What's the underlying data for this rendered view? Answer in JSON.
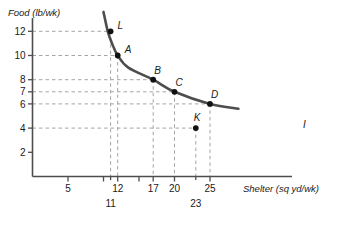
{
  "chart_data": {
    "type": "line",
    "title": "",
    "xlabel": "Shelter (sq yd/wk)",
    "ylabel": "Food (lb/wk)",
    "xlim": [
      0,
      29
    ],
    "ylim": [
      0,
      13.6
    ],
    "grid": "dashed-guides",
    "legend": "none",
    "curve_label": "I",
    "curve_description": "Indifference curve I, downward sloping convex",
    "curve_points": [
      {
        "x": 10.0,
        "y": 13.6
      },
      {
        "x": 10.6,
        "y": 12.0
      },
      {
        "x": 11.2,
        "y": 11.0
      },
      {
        "x": 12.0,
        "y": 10.0
      },
      {
        "x": 13.5,
        "y": 9.0
      },
      {
        "x": 17.0,
        "y": 8.0
      },
      {
        "x": 20.0,
        "y": 7.0
      },
      {
        "x": 25.0,
        "y": 6.0
      },
      {
        "x": 29.0,
        "y": 5.6
      }
    ],
    "points": [
      {
        "name": "L",
        "x": 11,
        "y": 12,
        "on_curve": false,
        "label_dx": 7,
        "label_dy": -2
      },
      {
        "name": "A",
        "x": 12,
        "y": 10,
        "on_curve": true,
        "label_dx": 7,
        "label_dy": -3
      },
      {
        "name": "B",
        "x": 17,
        "y": 8,
        "on_curve": true,
        "label_dx": 1,
        "label_dy": -6
      },
      {
        "name": "C",
        "x": 20,
        "y": 7,
        "on_curve": true,
        "label_dx": 1,
        "label_dy": -6
      },
      {
        "name": "D",
        "x": 25,
        "y": 6,
        "on_curve": true,
        "label_dx": 1,
        "label_dy": -6
      },
      {
        "name": "K",
        "x": 23,
        "y": 4,
        "on_curve": false,
        "label_dx": -2,
        "label_dy": -7
      }
    ],
    "x_ticks": [
      {
        "value": 5,
        "label": "5",
        "major": true,
        "offset_row": 0
      },
      {
        "value": 10,
        "label": "",
        "major": true,
        "offset_row": 0
      },
      {
        "value": 11,
        "label": "11",
        "major": false,
        "offset_row": 1
      },
      {
        "value": 12,
        "label": "12",
        "major": true,
        "offset_row": 0
      },
      {
        "value": 15,
        "label": "",
        "major": true,
        "offset_row": 0
      },
      {
        "value": 17,
        "label": "17",
        "major": true,
        "offset_row": 0
      },
      {
        "value": 20,
        "label": "20",
        "major": true,
        "offset_row": 0
      },
      {
        "value": 23,
        "label": "23",
        "major": false,
        "offset_row": 1
      },
      {
        "value": 25,
        "label": "25",
        "major": true,
        "offset_row": 0
      }
    ],
    "y_ticks": [
      {
        "value": 12,
        "label": "12"
      },
      {
        "value": 10,
        "label": "10"
      },
      {
        "value": 8,
        "label": "8"
      },
      {
        "value": 7,
        "label": "7"
      },
      {
        "value": 6,
        "label": "6"
      },
      {
        "value": 4,
        "label": "4"
      },
      {
        "value": 2,
        "label": "2"
      }
    ],
    "guide_lines": [
      {
        "from": "L",
        "axis": "y",
        "value": 12
      },
      {
        "from": "A",
        "axis": "y",
        "value": 10
      },
      {
        "from": "B",
        "axis": "y",
        "value": 8
      },
      {
        "from": "C",
        "axis": "y",
        "value": 7
      },
      {
        "from": "D",
        "axis": "y",
        "value": 6
      },
      {
        "from": "K",
        "axis": "y",
        "value": 4
      },
      {
        "from": "L",
        "axis": "x",
        "value": 11
      },
      {
        "from": "A",
        "axis": "x",
        "value": 12
      },
      {
        "from": "B",
        "axis": "x",
        "value": 17
      },
      {
        "from": "C",
        "axis": "x",
        "value": 20
      },
      {
        "from": "K",
        "axis": "x",
        "value": 23
      },
      {
        "from": "D",
        "axis": "x",
        "value": 25
      }
    ],
    "colors": {
      "curve": "#4d4d4d",
      "axis": "#4d4d4d",
      "guide": "#9a9a9a",
      "point": "#111111",
      "text": "#1a1a1a",
      "background": "#ffffff"
    }
  }
}
